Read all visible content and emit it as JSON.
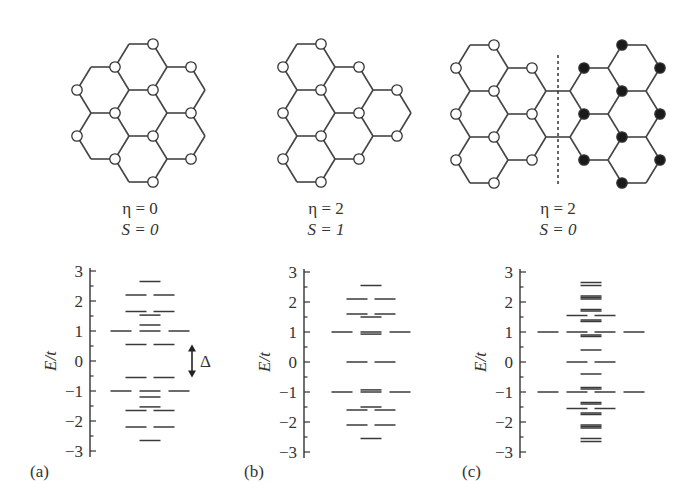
{
  "figure": {
    "line_color": "#444444",
    "filled_site_color": "#1a1a1a",
    "open_site_color": "#ffffff",
    "panels": [
      {
        "id": "a",
        "label": "(a)",
        "caption": {
          "eta": "η = 0",
          "spin": "S = 0"
        },
        "structure": "hexagonal graphene flake (7 rings, coronene-like), open circles on sublattice A",
        "annotation": "Δ"
      },
      {
        "id": "b",
        "label": "(b)",
        "caption": {
          "eta": "η = 2",
          "spin": "S = 1"
        },
        "structure": "triangular-like graphene flake (6 rings), open circles on one sublattice"
      },
      {
        "id": "c",
        "label": "(c)",
        "caption": {
          "eta": "η = 2",
          "spin": "S = 0"
        },
        "structure": "bowtie graphene flake, left half open circles, right half filled circles, dashed dividing line"
      }
    ]
  },
  "chart_data": [
    {
      "type": "scatter",
      "title": "(a) η = 0, S = 0",
      "ylabel": "E/t",
      "xlabel": "",
      "ylim": [
        -3,
        3
      ],
      "yticks": [
        -3,
        -2,
        -1,
        0,
        1,
        2,
        3
      ],
      "annotation": {
        "text": "Δ",
        "from": -0.55,
        "to": 0.55
      },
      "levels": [
        2.65,
        2.2,
        2.2,
        1.65,
        1.65,
        1.53,
        1.2,
        1.0,
        1.0,
        1.0,
        0.55,
        0.55,
        -0.55,
        -0.55,
        -1.0,
        -1.0,
        -1.0,
        -1.2,
        -1.53,
        -1.65,
        -1.65,
        -2.2,
        -2.2,
        -2.65
      ]
    },
    {
      "type": "scatter",
      "title": "(b) η = 2, S = 1",
      "ylabel": "E/t",
      "xlabel": "",
      "ylim": [
        -3,
        3
      ],
      "yticks": [
        -3,
        -2,
        -1,
        0,
        1,
        2,
        3
      ],
      "levels": [
        2.55,
        2.1,
        2.1,
        1.6,
        1.6,
        1.5,
        1.0,
        1.0,
        1.0,
        0.93,
        0.0,
        0.0,
        -0.93,
        -1.0,
        -1.0,
        -1.0,
        -1.5,
        -1.6,
        -1.6,
        -2.1,
        -2.1,
        -2.55
      ]
    },
    {
      "type": "scatter",
      "title": "(c) η = 2, S = 0",
      "ylabel": "E/t",
      "xlabel": "",
      "ylim": [
        -3,
        3
      ],
      "yticks": [
        -3,
        -2,
        -1,
        0,
        1,
        2,
        3
      ],
      "levels": [
        2.65,
        2.55,
        2.2,
        2.15,
        2.1,
        1.75,
        1.7,
        1.55,
        1.55,
        1.4,
        1.35,
        1.0,
        1.0,
        1.0,
        1.0,
        0.9,
        0.85,
        0.4,
        0.0,
        0.0,
        -0.4,
        -0.85,
        -0.9,
        -1.0,
        -1.0,
        -1.0,
        -1.0,
        -1.35,
        -1.4,
        -1.55,
        -1.55,
        -1.7,
        -1.75,
        -2.1,
        -2.15,
        -2.2,
        -2.55,
        -2.65
      ]
    }
  ]
}
